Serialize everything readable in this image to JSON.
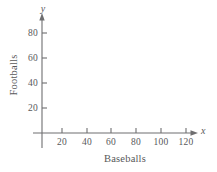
{
  "chart_data": {
    "type": "scatter",
    "title": "",
    "subtitle": "",
    "xlabel": "Baseballs",
    "ylabel": "Footballs",
    "x_axis_symbol": "x",
    "y_axis_symbol": "y",
    "xticks": [
      20,
      40,
      60,
      80,
      100,
      120
    ],
    "xtick_labels": [
      "20",
      "40",
      "60",
      "80",
      "100",
      "120"
    ],
    "yticks": [
      20,
      40,
      60,
      80
    ],
    "ytick_labels": [
      "20",
      "40",
      "60",
      "80"
    ],
    "xlim": [
      0,
      140
    ],
    "ylim": [
      0,
      96
    ],
    "series": [
      {
        "name": "",
        "x": [],
        "y": []
      }
    ],
    "grid": false,
    "legend": false,
    "annotations": [],
    "axis_style": "arrow-tipped empty coordinate grid",
    "axis_color": "#6e6e70",
    "text_color": "#58585a",
    "background_color": "#ffffff"
  },
  "figure": {
    "origin": {
      "x": 42,
      "y": 133
    },
    "x_axis_end": {
      "x": 197,
      "y": 133
    },
    "y_axis_top": {
      "x": 42,
      "y": 15
    },
    "y_axis_bottom": {
      "x": 42,
      "y": 148
    },
    "x_pixel_per_unit": 1.2361,
    "y_pixel_per_unit": 1.25,
    "tick_length": 5,
    "x_axis_title_pos": {
      "x": 125,
      "y": 158
    },
    "y_axis_title_pos": {
      "x": 13,
      "y": 75
    },
    "x_symbol_pos": {
      "x": 203,
      "y": 130
    },
    "y_symbol_pos": {
      "x": 42,
      "y": 9
    }
  }
}
